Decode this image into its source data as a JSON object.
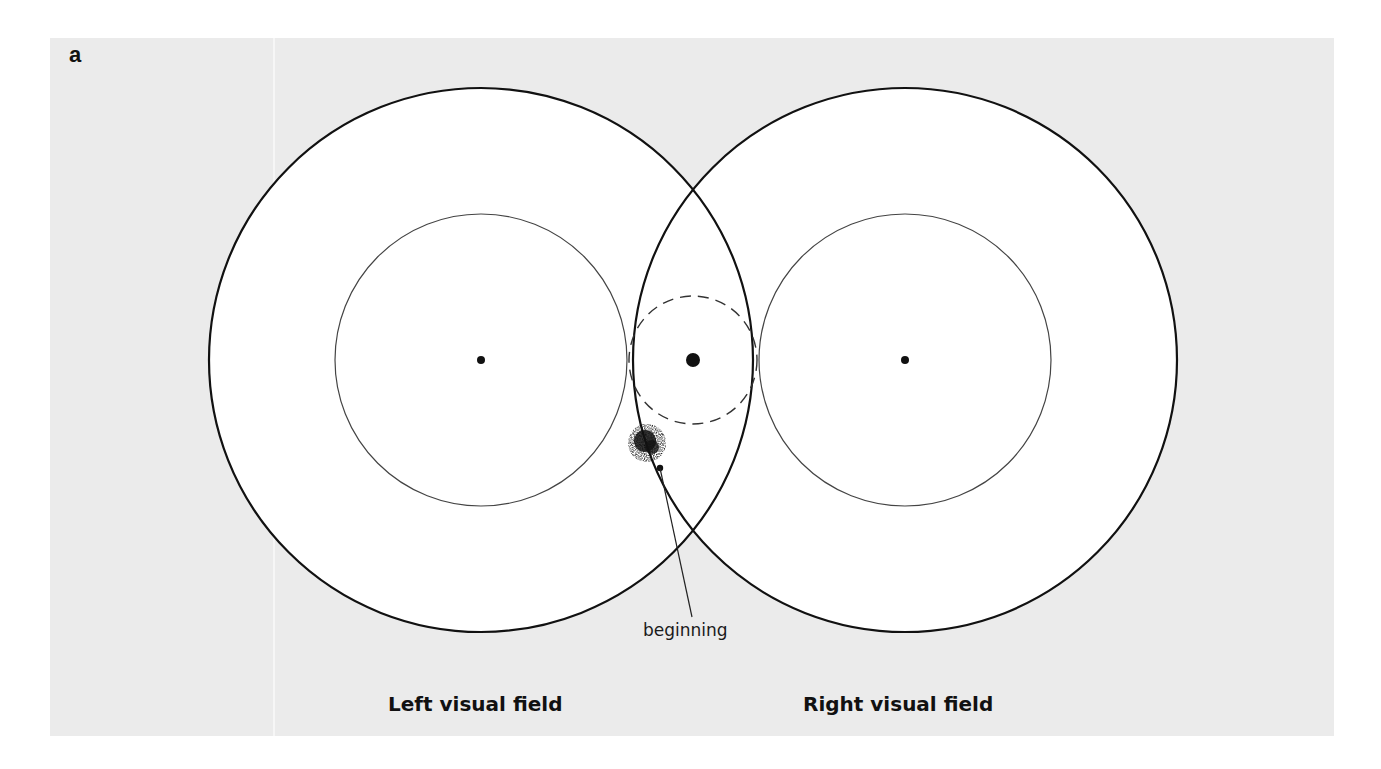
{
  "figure": {
    "panel_label": "a",
    "annotation": "beginning",
    "left_field_label": "Left visual field",
    "right_field_label": "Right visual field"
  },
  "colors": {
    "background": "#ebebeb",
    "field_fill": "#ffffff",
    "stroke": "#111111"
  },
  "shapes": {
    "left_outer_circle": {
      "cx": 481,
      "cy": 360,
      "r": 272
    },
    "right_outer_circle": {
      "cx": 905,
      "cy": 360,
      "r": 272
    },
    "left_inner_circle": {
      "cx": 481,
      "cy": 360,
      "r": 146
    },
    "right_inner_circle": {
      "cx": 905,
      "cy": 360,
      "r": 146
    },
    "center_dashed_circle": {
      "cx": 693,
      "cy": 360,
      "r": 64
    },
    "left_fixation_dot": {
      "cx": 481,
      "cy": 360,
      "r": 4
    },
    "right_fixation_dot": {
      "cx": 905,
      "cy": 360,
      "r": 4
    },
    "center_fixation_dot": {
      "cx": 693,
      "cy": 360,
      "r": 7
    }
  }
}
